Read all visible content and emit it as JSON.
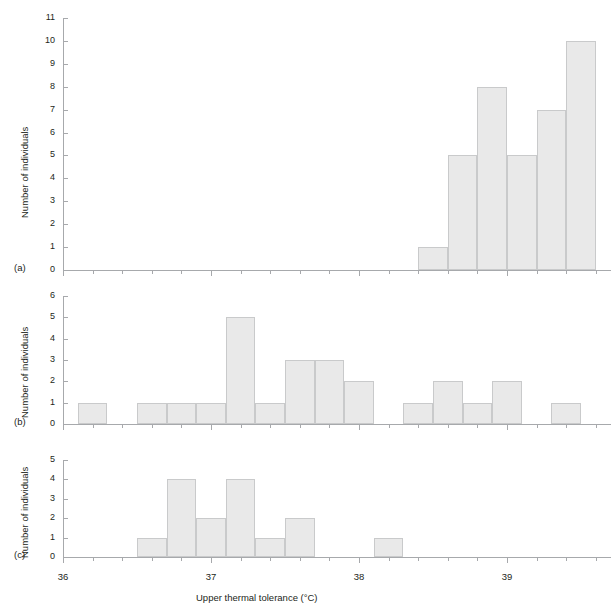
{
  "figure": {
    "xaxis_title": "Upper thermal tolerance (°C)",
    "yaxis_title": "Number of individuals",
    "xtick_labels": [
      "36",
      "37",
      "38",
      "39"
    ],
    "bar_fill": "#e9e9e9",
    "bar_stroke": "#c9cacb",
    "axis_color": "#a7a9ac"
  },
  "panels": [
    {
      "tag": "(a)",
      "ytick_labels": [
        "0",
        "1",
        "2",
        "3",
        "4",
        "5",
        "6",
        "7",
        "8",
        "9",
        "10",
        "11"
      ]
    },
    {
      "tag": "(b)",
      "ytick_labels": [
        "0",
        "1",
        "2",
        "3",
        "4",
        "5",
        "6"
      ]
    },
    {
      "tag": "(c)",
      "ytick_labels": [
        "0",
        "1",
        "2",
        "3",
        "4",
        "5"
      ]
    }
  ],
  "chart_data": [
    {
      "type": "bar",
      "title": "(a)",
      "xlabel": "Upper thermal tolerance (°C)",
      "ylabel": "Number of individuals",
      "xlim": [
        36.0,
        39.7
      ],
      "ylim": [
        0,
        11
      ],
      "bin_width": 0.2,
      "grid": false,
      "bins": [
        38.4,
        38.6,
        38.8,
        39.0,
        39.2,
        39.4
      ],
      "values": [
        1,
        5,
        8,
        5,
        7,
        10
      ]
    },
    {
      "type": "bar",
      "title": "(b)",
      "xlabel": "Upper thermal tolerance (°C)",
      "ylabel": "Number of individuals",
      "xlim": [
        36.0,
        39.7
      ],
      "ylim": [
        0,
        6
      ],
      "bin_width": 0.2,
      "grid": false,
      "bins": [
        36.1,
        36.5,
        36.7,
        36.9,
        37.1,
        37.3,
        37.5,
        37.7,
        37.9,
        38.3,
        38.5,
        38.7,
        38.9,
        39.3
      ],
      "values": [
        1,
        1,
        1,
        1,
        5,
        1,
        3,
        3,
        2,
        1,
        2,
        1,
        2,
        1
      ]
    },
    {
      "type": "bar",
      "title": "(c)",
      "xlabel": "Upper thermal tolerance (°C)",
      "ylabel": "Number of individuals",
      "xlim": [
        36.0,
        39.7
      ],
      "ylim": [
        0,
        5
      ],
      "bin_width": 0.2,
      "grid": false,
      "bins": [
        36.5,
        36.7,
        36.9,
        37.1,
        37.3,
        37.5,
        38.1
      ],
      "values": [
        1,
        4,
        2,
        4,
        1,
        2,
        1
      ]
    }
  ]
}
